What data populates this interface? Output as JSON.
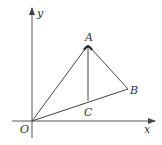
{
  "diagram": {
    "type": "geometry-coordinate-figure",
    "axes": {
      "x_label": "x",
      "y_label": "y",
      "origin_label": "O"
    },
    "points": {
      "A": {
        "label": "A",
        "px": [
          88,
          45
        ]
      },
      "B": {
        "label": "B",
        "px": [
          128,
          89
        ]
      },
      "C": {
        "label": "C",
        "px": [
          88,
          101
        ]
      },
      "O": {
        "label": "O",
        "px": [
          32,
          121
        ]
      }
    },
    "segments": [
      "OA",
      "AB",
      "OB",
      "AC"
    ],
    "colors": {
      "line": "#444444",
      "axis": "#555555",
      "text": "#333333",
      "background": "#ffffff"
    }
  }
}
